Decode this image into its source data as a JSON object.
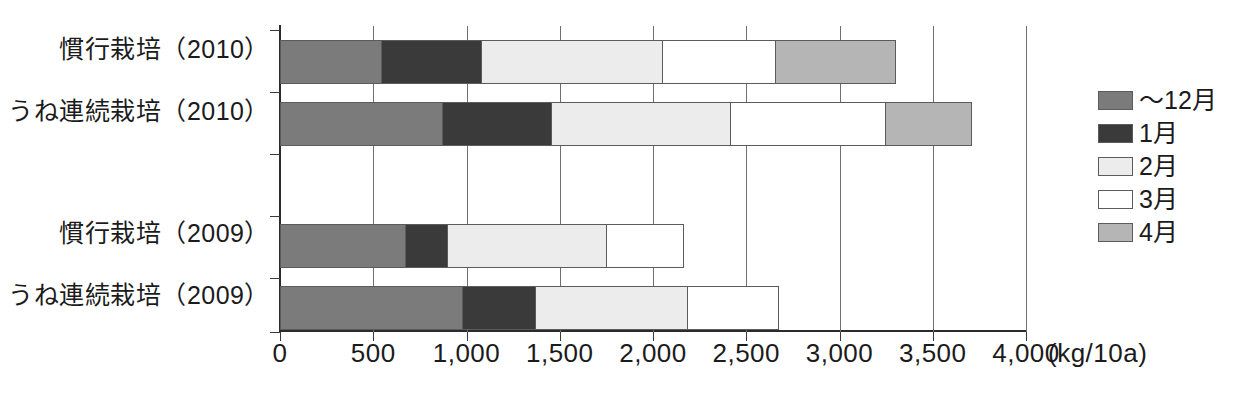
{
  "chart_data": {
    "type": "bar",
    "orientation": "horizontal",
    "stacked": true,
    "title": "",
    "xlabel": "(kg/10a)",
    "ylabel": "",
    "xlim": [
      0,
      4000
    ],
    "xticks": [
      "0",
      "500",
      "1,000",
      "1,500",
      "2,000",
      "2,500",
      "3,000",
      "3,500",
      "4,000"
    ],
    "xtick_values": [
      0,
      500,
      1000,
      1500,
      2000,
      2500,
      3000,
      3500,
      4000
    ],
    "grid": true,
    "legend_position": "right",
    "categories": [
      "慣行栽培（2010）",
      "うね連続栽培（2010）",
      "慣行栽培（2009）",
      "うね連続栽培（2009）"
    ],
    "series": [
      {
        "name": "～12月",
        "color": "#7b7b7b",
        "values": [
          545,
          875,
          675,
          980
        ]
      },
      {
        "name": "1月",
        "color": "#3a3a3a",
        "values": [
          545,
          590,
          230,
          400
        ]
      },
      {
        "name": "2月",
        "color": "#ececec",
        "values": [
          975,
          965,
          860,
          820
        ]
      },
      {
        "name": "3月",
        "color": "#ffffff",
        "values": [
          610,
          835,
          420,
          490
        ]
      },
      {
        "name": "4月",
        "color": "#b5b5b5",
        "values": [
          650,
          465,
          0,
          0
        ]
      }
    ],
    "totals": [
      3325,
      3730,
      2185,
      2690
    ],
    "annotations": []
  },
  "legend": {
    "items": [
      {
        "label": "～12月",
        "color": "#7b7b7b"
      },
      {
        "label": "1月",
        "color": "#3a3a3a"
      },
      {
        "label": "2月",
        "color": "#ececec"
      },
      {
        "label": "3月",
        "color": "#ffffff"
      },
      {
        "label": "4月",
        "color": "#b5b5b5"
      }
    ]
  },
  "axis": {
    "unit_label": "(kg/10a)"
  }
}
